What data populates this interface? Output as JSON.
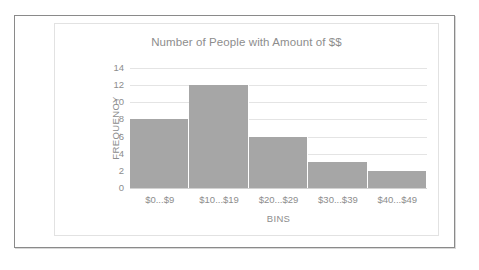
{
  "chart_data": {
    "type": "bar",
    "title": "Number of People with Amount of $$",
    "xlabel": "BINS",
    "ylabel": "FREQUENCY",
    "categories": [
      "$0...$9",
      "$10...$19",
      "$20...$29",
      "$30...$39",
      "$40...$49"
    ],
    "values": [
      8,
      12,
      6,
      3,
      2
    ],
    "ylim": [
      0,
      14
    ],
    "yticks": [
      0,
      2,
      4,
      6,
      8,
      10,
      12,
      14
    ],
    "ytick_labels": [
      "0",
      "2",
      "4",
      "6",
      "8",
      "10",
      "12",
      "14"
    ],
    "grid": true,
    "legend": false,
    "legend_position": "none",
    "colors": {
      "bar_fill": "#a6a6a6",
      "gridline": "#e4e4e4",
      "axis_text": "#8d8d8d",
      "title_text": "#8d8d8d",
      "chart_frame": "#e2e2e2",
      "outer_frame": "#8a8a8a",
      "background": "#ffffff"
    }
  }
}
